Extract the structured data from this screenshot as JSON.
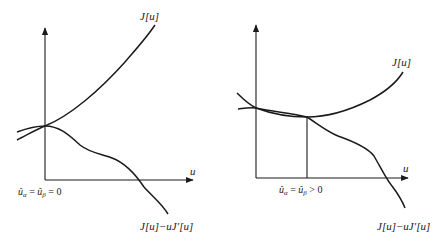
{
  "panels": [
    {
      "id": "left",
      "curve_top_label": "J[u]",
      "curve_bottom_label": "J[u]−uJ′[u]",
      "x_axis_label": "u",
      "origin_label": "ûα = ûβ = 0",
      "origin_label_parts": {
        "a": "û",
        "a_sub": "α",
        "eq1": " = ",
        "b": "û",
        "b_sub": "β",
        "rel": " = 0"
      }
    },
    {
      "id": "right",
      "curve_top_label": "J[u]",
      "curve_bottom_label": "J[u]−uJ′[u]",
      "x_axis_label": "u",
      "origin_label": "ûα = ûβ > 0",
      "origin_label_parts": {
        "a": "û",
        "a_sub": "α",
        "eq1": " = ",
        "b": "û",
        "b_sub": "β",
        "rel": " > 0"
      }
    }
  ],
  "colors": {
    "ink": "#1a1a1a",
    "background": "#ffffff"
  }
}
